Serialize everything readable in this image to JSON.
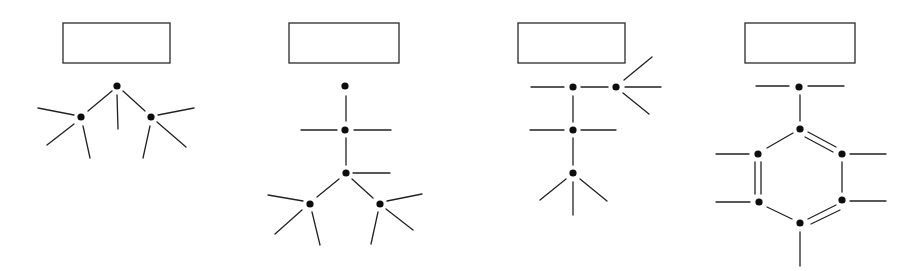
{
  "diagram": {
    "title": "",
    "colors": {
      "stroke": "#222222",
      "node": "#0d0d0d",
      "background": "#ffffff"
    },
    "structures": [
      {
        "id": "structure-1",
        "box": {
          "x": 63,
          "y": 23,
          "w": 107,
          "h": 40,
          "label": ""
        },
        "nodes": [
          [
            117,
            86
          ],
          [
            81,
            117
          ],
          [
            151,
            117
          ]
        ],
        "lines": [
          [
            112,
            91,
            88,
            111
          ],
          [
            123,
            91,
            145,
            111
          ],
          [
            117,
            95,
            118,
            129
          ],
          [
            74,
            115,
            38,
            108
          ],
          [
            74,
            124,
            47,
            145
          ],
          [
            83,
            126,
            90,
            158
          ],
          [
            158,
            115,
            194,
            108
          ],
          [
            157,
            122,
            186,
            147
          ],
          [
            150,
            126,
            143,
            158
          ]
        ]
      },
      {
        "id": "structure-2",
        "box": {
          "x": 289,
          "y": 23,
          "w": 110,
          "h": 40,
          "label": ""
        },
        "nodes": [
          [
            345,
            86
          ],
          [
            345,
            130
          ],
          [
            346,
            173
          ],
          [
            310,
            204
          ],
          [
            380,
            204
          ]
        ],
        "lines": [
          [
            346,
            96,
            346,
            121
          ],
          [
            301,
            130,
            337,
            130
          ],
          [
            354,
            130,
            391,
            130
          ],
          [
            346,
            138,
            346,
            165
          ],
          [
            353,
            173,
            390,
            173
          ],
          [
            339,
            179,
            317,
            197
          ],
          [
            352,
            179,
            373,
            198
          ],
          [
            303,
            201,
            268,
            195
          ],
          [
            302,
            210,
            275,
            234
          ],
          [
            312,
            212,
            320,
            245
          ],
          [
            387,
            201,
            422,
            194
          ],
          [
            386,
            209,
            413,
            230
          ],
          [
            378,
            212,
            371,
            244
          ]
        ]
      },
      {
        "id": "structure-3",
        "box": {
          "x": 518,
          "y": 23,
          "w": 107,
          "h": 40,
          "label": ""
        },
        "nodes": [
          [
            573,
            87
          ],
          [
            616,
            87
          ],
          [
            573,
            130
          ],
          [
            573,
            173
          ]
        ],
        "lines": [
          [
            531,
            87,
            564,
            87
          ],
          [
            581,
            87,
            608,
            87
          ],
          [
            624,
            80,
            652,
            57
          ],
          [
            625,
            87,
            661,
            87
          ],
          [
            623,
            93,
            649,
            114
          ],
          [
            573,
            96,
            573,
            122
          ],
          [
            530,
            130,
            564,
            130
          ],
          [
            581,
            130,
            616,
            130
          ],
          [
            573,
            138,
            573,
            165
          ],
          [
            566,
            179,
            540,
            200
          ],
          [
            573,
            182,
            573,
            215
          ],
          [
            580,
            179,
            607,
            201
          ]
        ]
      },
      {
        "id": "structure-4",
        "box": {
          "x": 745,
          "y": 23,
          "w": 110,
          "h": 40,
          "label": ""
        },
        "nodes": [
          [
            799,
            87
          ],
          [
            800,
            129
          ],
          [
            758,
            154
          ],
          [
            842,
            154
          ],
          [
            759,
            202
          ],
          [
            842,
            200
          ],
          [
            800,
            223
          ]
        ],
        "lines": [
          [
            756,
            86,
            789,
            86
          ],
          [
            808,
            86,
            844,
            86
          ],
          [
            800,
            95,
            800,
            121
          ],
          [
            793,
            133,
            767,
            148
          ],
          [
            808,
            132,
            836,
            147
          ],
          [
            805,
            137,
            833,
            152
          ],
          [
            716,
            154,
            749,
            154
          ],
          [
            850,
            154,
            886,
            154
          ],
          [
            755,
            162,
            755,
            194
          ],
          [
            761,
            162,
            761,
            194
          ],
          [
            842,
            162,
            842,
            192
          ],
          [
            716,
            202,
            750,
            202
          ],
          [
            850,
            201,
            886,
            201
          ],
          [
            767,
            207,
            792,
            219
          ],
          [
            808,
            219,
            836,
            205
          ],
          [
            811,
            224,
            840,
            210
          ],
          [
            800,
            232,
            800,
            266
          ]
        ]
      }
    ]
  }
}
